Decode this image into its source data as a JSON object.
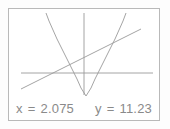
{
  "device": {
    "screen_name": "graphing-calculator-screen",
    "background_color": "#fdfdfd",
    "frame_border_color": "#b9b9b9",
    "curve_color": "#9a9a9a",
    "axis_color": "#9a9a9a",
    "text_color": "#8a8a8a"
  },
  "readout": {
    "x": {
      "var_label": "x",
      "equals": "=",
      "value": "2.075"
    },
    "y": {
      "var_label": "y",
      "equals": "=",
      "value": "11.23"
    }
  },
  "chart_data": {
    "type": "line",
    "title": "",
    "xlabel": "",
    "ylabel": "",
    "grid": false,
    "legend": null,
    "axes": {
      "x_axis_pixel_y": 64,
      "y_axis_pixel_x": 75,
      "x_axis_span_px": [
        12,
        144
      ],
      "y_axis_span_px": [
        4,
        86
      ]
    },
    "series": [
      {
        "name": "parabola",
        "type": "parabola",
        "stroke": "#9a9a9a",
        "vertex_px": [
          77,
          87
        ],
        "points_px": [
          [
            37,
            4
          ],
          [
            40,
            12
          ],
          [
            44,
            21
          ],
          [
            48,
            30
          ],
          [
            52,
            38
          ],
          [
            56,
            46
          ],
          [
            60,
            54
          ],
          [
            64,
            62
          ],
          [
            68,
            70
          ],
          [
            72,
            79
          ],
          [
            77,
            87
          ],
          [
            82,
            79
          ],
          [
            86,
            70
          ],
          [
            90,
            62
          ],
          [
            94,
            54
          ],
          [
            98,
            46
          ],
          [
            102,
            38
          ],
          [
            106,
            30
          ],
          [
            110,
            21
          ],
          [
            114,
            12
          ],
          [
            117,
            4
          ]
        ]
      },
      {
        "name": "straight-line",
        "type": "line",
        "stroke": "#9a9a9a",
        "points_px": [
          [
            12,
            80
          ],
          [
            132,
            20
          ]
        ]
      }
    ],
    "intersections_px": [
      [
        49,
        61
      ],
      [
        117,
        27
      ]
    ]
  }
}
